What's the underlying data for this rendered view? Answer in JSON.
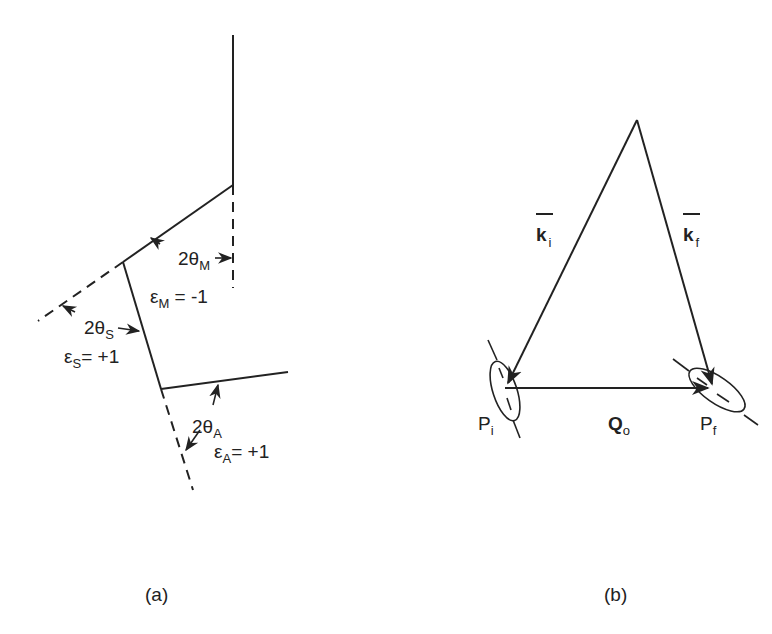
{
  "figure": {
    "panel_a": {
      "caption": "(a)",
      "labels": {
        "two_theta_m": {
          "main": "2θ",
          "sub": "M"
        },
        "eps_m": {
          "main": "ε",
          "sub": "M",
          "value": " = -1"
        },
        "two_theta_s": {
          "main": "2θ",
          "sub": "S"
        },
        "eps_s": {
          "main": "ε",
          "sub": "S",
          "value": "= +1"
        },
        "two_theta_a": {
          "main": "2θ",
          "sub": "A"
        },
        "eps_a": {
          "main": "ε",
          "sub": "A",
          "value": "= +1"
        }
      }
    },
    "panel_b": {
      "caption": "(b)",
      "labels": {
        "k_i": {
          "main": "k",
          "sub": "i"
        },
        "k_f": {
          "main": "k",
          "sub": "f"
        },
        "q_o": {
          "main": "Q",
          "sub": "o"
        },
        "p_i": {
          "main": "P",
          "sub": "i"
        },
        "p_f": {
          "main": "P",
          "sub": "f"
        }
      }
    }
  }
}
